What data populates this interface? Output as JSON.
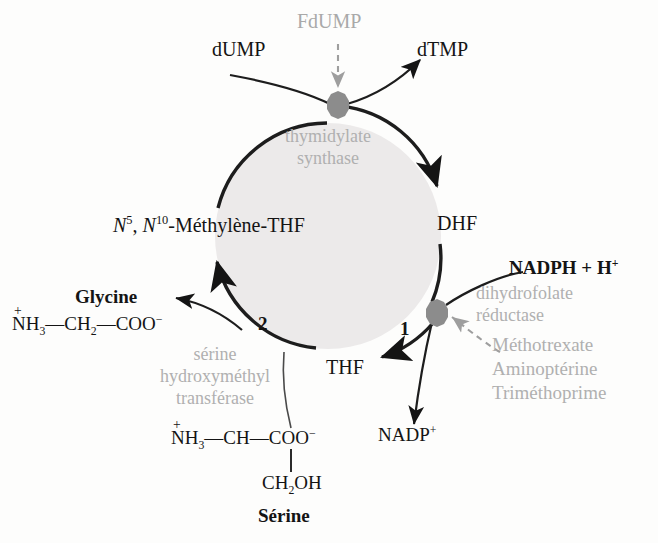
{
  "diagram": {
    "colors": {
      "ink": "#141414",
      "gray_text": "#a9a9a9",
      "node_fill": "#8c8c8c",
      "circle_fill": "#eceaea",
      "circle_stroke": "#2a2a2a",
      "background": "#fdfdfc"
    }
  },
  "top": {
    "substrate": "dUMP",
    "inhibitor": "FdUMP",
    "product": "dTMP"
  },
  "enzymes": {
    "thymidylate_synthase": {
      "line1": "thymidylate",
      "line2": "synthase"
    },
    "dihydrofolate_reductase": {
      "line1": "dihydrofolate",
      "line2": "réductase"
    },
    "serine_hydroxymethyl_transferase": {
      "line1": "sérine",
      "line2": "hydroxyméthyl",
      "line3": "transférase"
    }
  },
  "metabolites": {
    "methylene_thf_prefix_n": "N",
    "methylene_thf_sup1": "5",
    "methylene_thf_mid": ", ",
    "methylene_thf_prefix_n2": "N",
    "methylene_thf_sup2": "10",
    "methylene_thf_rest": "-Méthylène-THF",
    "dhf": "DHF",
    "thf": "THF",
    "nadph": "NADPH + H",
    "nadph_sup": "+",
    "nadp": "NADP",
    "nadp_sup": "+"
  },
  "steps": {
    "step1": "1",
    "step2": "2"
  },
  "inhibitors_dhfr": [
    "Méthotrexate",
    "Aminoptérine",
    "Triméthoprime"
  ],
  "glycine": {
    "name": "Glycine",
    "nh3": "NH",
    "nh3_sub": "3",
    "charge_plus": "+",
    "bond1": "—",
    "ch2": "CH",
    "ch2_sub": "2",
    "bond2": "—",
    "coo": "COO",
    "coo_sup": "−"
  },
  "serine": {
    "name": "Sérine",
    "nh3": "NH",
    "nh3_sub": "3",
    "charge_plus": "+",
    "bond1": "—",
    "ch": "CH",
    "bond2": "—",
    "coo": "COO",
    "coo_sup": "−",
    "side_chain": "CH",
    "side_chain_sub": "2",
    "side_chain_tail": "OH"
  }
}
